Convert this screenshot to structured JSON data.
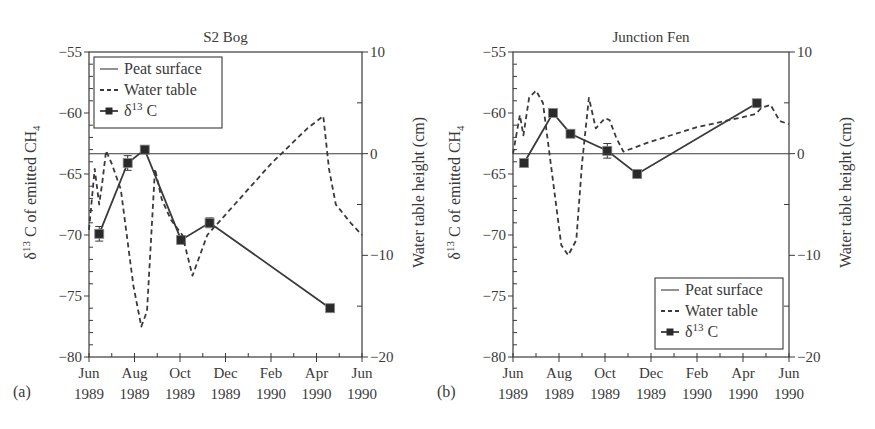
{
  "figure": {
    "panels": [
      {
        "id": "a",
        "panel_label": "(a)",
        "title": "S2 Bog",
        "ylabel_left_prefix": "δ",
        "ylabel_left_sup": "13",
        "ylabel_left_main": " C of emitted CH",
        "ylabel_left_sub": "4",
        "ylabel_right": "Water table height (cm)",
        "legend_position": "upper-left",
        "legend": [
          "Peat surface",
          "Water table",
          "δ13 C"
        ]
      },
      {
        "id": "b",
        "panel_label": "(b)",
        "title": "Junction Fen",
        "ylabel_left_prefix": "δ",
        "ylabel_left_sup": "13",
        "ylabel_left_main": " C of emitted CH",
        "ylabel_left_sub": "4",
        "ylabel_right": "Water table height (cm)",
        "legend_position": "lower-right",
        "legend": [
          "Peat surface",
          "Water table",
          "δ13 C"
        ]
      }
    ],
    "x_ticks": [
      {
        "month": 0,
        "line1": "Jun",
        "line2": "1989"
      },
      {
        "month": 2,
        "line1": "Aug",
        "line2": "1989"
      },
      {
        "month": 4,
        "line1": "Oct",
        "line2": "1989"
      },
      {
        "month": 6,
        "line1": "Dec",
        "line2": "1989"
      },
      {
        "month": 8,
        "line1": "Feb",
        "line2": "1990"
      },
      {
        "month": 10,
        "line1": "Apr",
        "line2": "1990"
      },
      {
        "month": 12,
        "line1": "Jun",
        "line2": "1990"
      }
    ],
    "y_left_ticks": [
      -55,
      -60,
      -65,
      -70,
      -75,
      -80
    ],
    "y_right_ticks": [
      10,
      0,
      -10,
      -20
    ]
  },
  "chart_data": [
    {
      "type": "line",
      "title": "S2 Bog",
      "panel": "(a)",
      "xlabel": "",
      "ylabel": "δ13C of emitted CH4",
      "ylabel_right": "Water table height (cm)",
      "x_unit": "months since Jun 1989",
      "xlim": [
        0,
        12
      ],
      "ylim": [
        -80,
        -55
      ],
      "ylim_right": [
        -20,
        10
      ],
      "legend": [
        "Peat surface",
        "Water table",
        "δ13 C"
      ],
      "legend_position": "upper-left",
      "series": [
        {
          "name": "δ13 C",
          "axis": "left",
          "style": "solid-square-markers",
          "x": [
            0.45,
            1.7,
            2.45,
            4.05,
            5.3,
            10.6
          ],
          "values": [
            -69.9,
            -64.1,
            -63.0,
            -70.4,
            -69.0,
            -76.0
          ],
          "error": [
            0.6,
            0.6,
            0.2,
            0.3,
            0.4,
            0.2
          ]
        },
        {
          "name": "Water table",
          "axis": "right",
          "style": "dashed",
          "x": [
            0.0,
            0.25,
            0.45,
            0.6,
            0.75,
            1.0,
            1.4,
            1.95,
            2.3,
            2.55,
            2.9,
            3.2,
            3.6,
            4.1,
            4.55,
            5.2,
            6.4,
            8.0,
            9.6,
            10.3,
            10.55,
            10.85,
            11.5,
            12.0
          ],
          "values": [
            -7.5,
            -1.5,
            -5.0,
            -2.5,
            0.3,
            -1.0,
            -3.5,
            -13.0,
            -17.0,
            -15.5,
            -1.5,
            -4.5,
            -6.5,
            -8.0,
            -12.0,
            -8.0,
            -5.0,
            -1.0,
            2.5,
            3.7,
            -1.5,
            -5.0,
            -6.8,
            -8.0
          ]
        },
        {
          "name": "Peat surface",
          "axis": "right",
          "style": "solid",
          "x": [
            0,
            12
          ],
          "values": [
            0,
            0
          ]
        }
      ]
    },
    {
      "type": "line",
      "title": "Junction Fen",
      "panel": "(b)",
      "xlabel": "",
      "ylabel": "δ13C of emitted CH4",
      "ylabel_right": "Water table height (cm)",
      "x_unit": "months since Jun 1989",
      "xlim": [
        0,
        12
      ],
      "ylim": [
        -80,
        -55
      ],
      "ylim_right": [
        -20,
        10
      ],
      "legend": [
        "Peat surface",
        "Water table",
        "δ13 C"
      ],
      "legend_position": "lower-right",
      "series": [
        {
          "name": "δ13 C",
          "axis": "left",
          "style": "solid-square-markers",
          "x": [
            0.48,
            1.74,
            2.5,
            4.1,
            5.4,
            10.6
          ],
          "values": [
            -64.1,
            -60.0,
            -61.7,
            -63.1,
            -65.0,
            -59.2
          ],
          "error": [
            0.2,
            0.2,
            0.2,
            0.6,
            0.2,
            0.2
          ]
        },
        {
          "name": "Water table",
          "axis": "right",
          "style": "dashed",
          "x": [
            0.0,
            0.3,
            0.45,
            0.7,
            1.0,
            1.3,
            1.7,
            2.1,
            2.4,
            2.75,
            3.0,
            3.3,
            3.6,
            4.0,
            4.2,
            4.5,
            4.8,
            6.0,
            8.0,
            10.0,
            10.55,
            10.8,
            11.2,
            11.6,
            12.0
          ],
          "values": [
            0.0,
            3.8,
            1.8,
            5.5,
            6.2,
            5.0,
            -2.0,
            -9.0,
            -10.0,
            -8.5,
            -1.0,
            5.5,
            2.5,
            3.5,
            3.3,
            1.5,
            0.2,
            1.2,
            2.6,
            3.6,
            3.9,
            4.5,
            4.8,
            3.2,
            2.9
          ]
        },
        {
          "name": "Peat surface",
          "axis": "right",
          "style": "solid",
          "x": [
            0,
            12
          ],
          "values": [
            0,
            0
          ]
        }
      ]
    }
  ]
}
